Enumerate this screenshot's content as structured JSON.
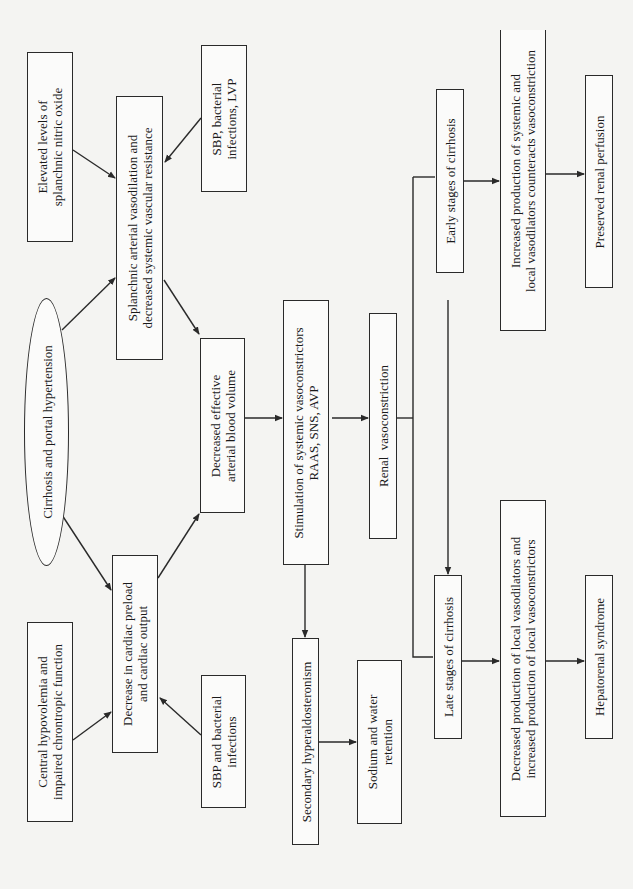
{
  "diagram": {
    "orientation": "rotated-90-counterclockwise",
    "nodes": {
      "elevated_no": {
        "line1": "Elevated levels of",
        "line2": "splanchnic nitric oxide"
      },
      "splanchnic": {
        "line1": "Splanchnic arterial vasodilation and",
        "line2": "decreased systemic vascular resistance"
      },
      "sbp_lvp": {
        "line1": "SBP, bacterial",
        "line2": "infections, LVP"
      },
      "cirrhosis": {
        "line1": "Cirrhosis and portal hypertension"
      },
      "decreased_eabv": {
        "line1": "Decreased effective",
        "line2": "arterial blood volume"
      },
      "cardiac_preload": {
        "line1": "Decrease in cardiac preload",
        "line2": "and cardiac output"
      },
      "central_hypovolemia": {
        "line1": "Central hypovolemia and",
        "line2": "impaired chrontropic function"
      },
      "sbp_infections": {
        "line1": "SBP and bacterial",
        "line2": "infections"
      },
      "stimulation": {
        "line1": "Stimulation of systemic vasoconstrictors",
        "line2": "RAAS, SNS, AVP"
      },
      "renal_vasoconstriction": {
        "line1": "Renal  vasoconstriction"
      },
      "early_stages": {
        "line1": "Early stages of cirrhosis"
      },
      "increased_production": {
        "line1": "Increased production of systemic and",
        "line2": "local vasodilators counteracts vasoconstriction"
      },
      "preserved_renal": {
        "line1": "Preserved renal perfusion"
      },
      "secondary_hyperaldo": {
        "line1": "Secondary hyperaldosteronism"
      },
      "sodium_water": {
        "line1": "Sodium and water",
        "line2": "retention"
      },
      "late_stages": {
        "line1": "Late stages of cirrhosis"
      },
      "decreased_production": {
        "line1": "Decreased production of local vasodilators and",
        "line2": "increased production of local vasoconstrictors"
      },
      "hepatorenal": {
        "line1": "Hepatorenal syndrome"
      }
    },
    "edges": [
      {
        "from": "elevated_no",
        "to": "splanchnic"
      },
      {
        "from": "sbp_lvp",
        "to": "splanchnic"
      },
      {
        "from": "cirrhosis",
        "to": "splanchnic"
      },
      {
        "from": "cirrhosis",
        "to": "cardiac_preload"
      },
      {
        "from": "splanchnic",
        "to": "decreased_eabv"
      },
      {
        "from": "cardiac_preload",
        "to": "decreased_eabv"
      },
      {
        "from": "central_hypovolemia",
        "to": "cardiac_preload"
      },
      {
        "from": "sbp_infections",
        "to": "cardiac_preload"
      },
      {
        "from": "decreased_eabv",
        "to": "stimulation"
      },
      {
        "from": "stimulation",
        "to": "renal_vasoconstriction"
      },
      {
        "from": "stimulation",
        "to": "secondary_hyperaldo"
      },
      {
        "from": "secondary_hyperaldo",
        "to": "sodium_water"
      },
      {
        "from": "renal_vasoconstriction",
        "to": "early_stages"
      },
      {
        "from": "renal_vasoconstriction",
        "to": "late_stages"
      },
      {
        "from": "early_stages",
        "to": "increased_production"
      },
      {
        "from": "increased_production",
        "to": "preserved_renal"
      },
      {
        "from": "late_stages",
        "to": "decreased_production"
      },
      {
        "from": "decreased_production",
        "to": "hepatorenal"
      }
    ]
  }
}
